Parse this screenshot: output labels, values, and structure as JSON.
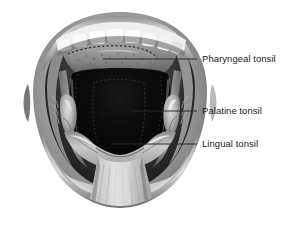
{
  "figure": {
    "background_color": "#ffffff",
    "style": "grayscale-medical-illustration",
    "colors": {
      "background": "#ffffff",
      "lip_light": "#d8d8d8",
      "lip_mid": "#9a9a9a",
      "lip_dark": "#5e5e5e",
      "oral_cavity_dark": "#0a0a0a",
      "throat_black": "#050505",
      "tooth_white": "#f2f2f2",
      "tongue_light": "#cfcfcf",
      "tongue_mid": "#a5a5a5",
      "palate_gray": "#8d8d8d",
      "leader_line": "#2a2a2a",
      "label_text": "#1b1b1b"
    }
  },
  "labels": [
    {
      "id": "pharyngeal",
      "text": "Pharyngeal tonsil",
      "text_x": 202,
      "text_y": 53,
      "leader": {
        "x1": 103,
        "y1": 59,
        "x2": 197,
        "y2": 59
      }
    },
    {
      "id": "palatine",
      "text": "Palatine tonsil",
      "text_x": 202,
      "text_y": 105,
      "leader": {
        "x1": 131,
        "y1": 111,
        "x2": 197,
        "y2": 111
      }
    },
    {
      "id": "lingual",
      "text": "Lingual tonsil",
      "text_x": 202,
      "text_y": 138,
      "leader": {
        "x1": 112,
        "y1": 144,
        "x2": 197,
        "y2": 144
      }
    }
  ],
  "anatomy_parts": [
    {
      "name": "upper-lip",
      "description": "Upper lip arc across top of mouth"
    },
    {
      "name": "lower-lip",
      "description": "Lower lip arc across bottom of mouth"
    },
    {
      "name": "upper-teeth-row",
      "description": "Row of upper incisors and canines"
    },
    {
      "name": "hard-soft-palate",
      "description": "Roof of mouth above throat"
    },
    {
      "name": "pharyngeal-tonsil",
      "description": "Adenoid at roof of nasopharynx, dotted outline"
    },
    {
      "name": "palatine-tonsil-left",
      "description": "Tonsil in left tonsillar fossa"
    },
    {
      "name": "palatine-tonsil-right",
      "description": "Tonsil in right tonsillar fossa"
    },
    {
      "name": "lingual-tonsil",
      "description": "Lymphoid tissue at base of tongue"
    },
    {
      "name": "tongue",
      "description": "Protruding tongue extending downward out of mouth"
    },
    {
      "name": "oropharynx-cavity",
      "description": "Dark throat opening"
    },
    {
      "name": "anterior-pillar-left",
      "description": "Palatoglossal arch left"
    },
    {
      "name": "anterior-pillar-right",
      "description": "Palatoglossal arch right"
    }
  ]
}
